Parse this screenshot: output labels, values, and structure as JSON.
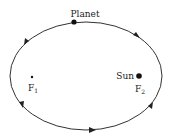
{
  "diagram": {
    "labels": {
      "planet": "Planet",
      "sun": "Sun",
      "focus1_letter": "F",
      "focus1_sub": "1",
      "focus2_letter": "F",
      "focus2_sub": "2"
    },
    "ellipse": {
      "cx": 86,
      "cy": 76,
      "rx": 76,
      "ry": 54
    },
    "colors": {
      "line": "#333333",
      "dot": "#111111",
      "background": "#ffffff"
    }
  }
}
